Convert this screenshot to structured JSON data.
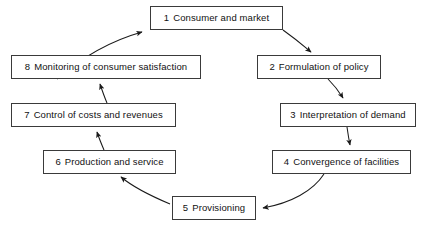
{
  "diagram": {
    "type": "cycle-flow",
    "title": "",
    "nodes": [
      {
        "id": "n1",
        "number": "1",
        "label": "Consumer and market",
        "x": 150,
        "y": 6,
        "w": 133,
        "h": 24
      },
      {
        "id": "n2",
        "number": "2",
        "label": "Formulation of policy",
        "x": 257,
        "y": 55,
        "w": 124,
        "h": 24
      },
      {
        "id": "n3",
        "number": "3",
        "label": "Interpretation of demand",
        "x": 280,
        "y": 103,
        "w": 136,
        "h": 24
      },
      {
        "id": "n4",
        "number": "4",
        "label": "Convergence of facilities",
        "x": 272,
        "y": 150,
        "w": 139,
        "h": 24
      },
      {
        "id": "n5",
        "number": "5",
        "label": "Provisioning",
        "x": 172,
        "y": 196,
        "w": 84,
        "h": 24
      },
      {
        "id": "n6",
        "number": "6",
        "label": "Production and service",
        "x": 43,
        "y": 150,
        "w": 133,
        "h": 24
      },
      {
        "id": "n7",
        "number": "7",
        "label": "Control of costs and revenues",
        "x": 11,
        "y": 103,
        "w": 165,
        "h": 24
      },
      {
        "id": "n8",
        "number": "8",
        "label": "Monitoring of consumer satisfaction",
        "x": 11,
        "y": 55,
        "w": 190,
        "h": 24
      }
    ],
    "edges": [
      {
        "from": "1",
        "to": "2",
        "path": "M 283 30 C 297 40 305 47 312 53"
      },
      {
        "from": "2",
        "to": "3",
        "path": "M 328 79 C 336 88 340 93 343 99"
      },
      {
        "from": "3",
        "to": "4",
        "path": "M 348 127 C 349 135 349 140 350 146"
      },
      {
        "from": "4",
        "to": "5",
        "path": "M 323 174 C 312 190 290 202 262 208"
      },
      {
        "from": "5",
        "to": "6",
        "path": "M 170 205 C 150 196 133 187 122 178"
      },
      {
        "from": "6",
        "to": "7",
        "path": "M 104 150 C 101 143 99 138 97 131"
      },
      {
        "from": "7",
        "to": "8",
        "path": "M 106 103 C 104 96 102 90 100 83"
      },
      {
        "from": "8",
        "to": "1",
        "path": "M 58 79 C 80 60 110 42 143 32"
      }
    ],
    "arrow_color": "#1a1a1a",
    "box_border_color": "#3a3a3a"
  },
  "caption": {
    "label": "",
    "text": ""
  }
}
